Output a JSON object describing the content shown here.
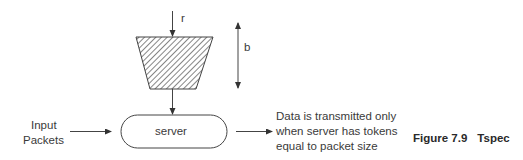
{
  "diagram": {
    "rate_label": "r",
    "bucket_depth_label": "b",
    "bucket": {
      "shape": "trapezoid",
      "fill": "hatched"
    },
    "server_label": "server",
    "input_label_line1": "Input",
    "input_label_line2": "Packets",
    "output_text": [
      "Data is transmitted only",
      "when server has tokens",
      "equal to packet size"
    ],
    "line_color": "#444444"
  },
  "caption": {
    "figure_number": "Figure 7.9",
    "title": "Tspec"
  }
}
